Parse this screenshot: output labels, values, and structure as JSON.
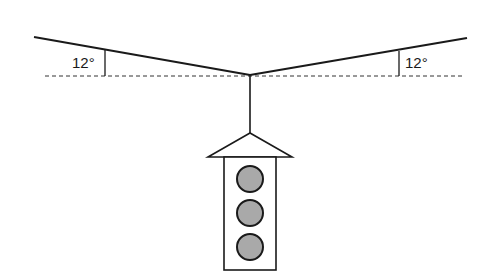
{
  "diagram": {
    "type": "traffic-light-suspension",
    "angles": {
      "left": {
        "value": "12°"
      },
      "right": {
        "value": "12°"
      }
    },
    "traffic_light": {
      "lamp_count": 3
    },
    "colors": {
      "stroke": "#1a1a1a",
      "lamp_fill": "#a9a9a9",
      "background": "#ffffff"
    }
  }
}
